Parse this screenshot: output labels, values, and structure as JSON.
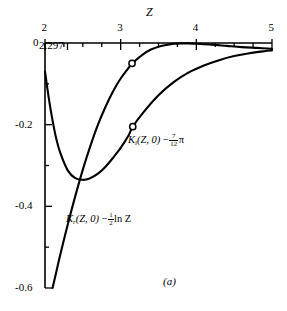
{
  "figure": {
    "caption": "(a)",
    "axis_name": "Z",
    "note_label": "2.297"
  },
  "chart_data": {
    "type": "line",
    "title": "",
    "xlabel": "Z",
    "ylabel": "",
    "xlim": [
      2,
      5
    ],
    "ylim": [
      -0.6,
      0.0
    ],
    "x_axis_position": "top",
    "y_axis_position": "left",
    "grid": false,
    "legend": "inline-annotations",
    "xticks": [
      2,
      3,
      4,
      5
    ],
    "xticklabels": [
      "2",
      "3",
      "4",
      "5"
    ],
    "x_minor_tick_step": 0.25,
    "yticks": [
      0,
      -0.2,
      -0.4,
      -0.6
    ],
    "yticklabels": [
      "0",
      "-0.2",
      "-0.4",
      "-0.6"
    ],
    "y_minor_tick_step": 0.1,
    "annotations": [
      {
        "text": "2.297",
        "x": 2.297,
        "note": "value marked below top axis"
      },
      {
        "text": "(a)",
        "note": "figure panel caption"
      }
    ],
    "markers": [
      {
        "series": "Ki(Z,0) - 7/12 pi",
        "x": 3.15,
        "y": -0.05,
        "style": "open-circle"
      },
      {
        "series": "Kr(Z,0) - 1/2 ln Z",
        "x": 3.16,
        "y": -0.205,
        "style": "open-circle"
      }
    ],
    "series": [
      {
        "name": "Ki(Z,0) - 7/12 pi",
        "label_text": "K i ( Z , 0 ) - 7/12 pi",
        "label_parts": {
          "fn": "K",
          "sub": "i",
          "args": "(Z, 0)",
          "minus": "−",
          "frac_num": "7",
          "frac_den": "12",
          "tail": "π"
        },
        "x": [
          2.1,
          2.15,
          2.2,
          2.3,
          2.4,
          2.5,
          2.6,
          2.7,
          2.8,
          2.9,
          3.0,
          3.1,
          3.15,
          3.2,
          3.3,
          3.4,
          3.5,
          3.6,
          3.7,
          3.8,
          3.9,
          4.0,
          4.2,
          4.4,
          4.6,
          4.8,
          5.0
        ],
        "y": [
          -0.6,
          -0.56,
          -0.52,
          -0.445,
          -0.375,
          -0.31,
          -0.252,
          -0.2,
          -0.156,
          -0.118,
          -0.087,
          -0.062,
          -0.051,
          -0.042,
          -0.027,
          -0.016,
          -0.009,
          -0.005,
          -0.002,
          -0.001,
          -0.001,
          -0.002,
          -0.004,
          -0.007,
          -0.01,
          -0.012,
          -0.014
        ]
      },
      {
        "name": "Kr(Z,0) - 1/2 ln Z",
        "label_text": "K r ( Z , 0 ) - 1/2 ln Z",
        "label_parts": {
          "fn": "K",
          "sub": "r",
          "args": "(Z, 0)",
          "minus": "−",
          "frac_num": "1",
          "frac_den": "2",
          "tail": "ln Z"
        },
        "x": [
          2.0,
          2.05,
          2.1,
          2.15,
          2.2,
          2.3,
          2.4,
          2.5,
          2.55,
          2.6,
          2.7,
          2.8,
          2.9,
          3.0,
          3.1,
          3.16,
          3.3,
          3.5,
          3.7,
          3.9,
          4.1,
          4.3,
          4.5,
          4.7,
          4.9,
          5.0
        ],
        "y": [
          -0.07,
          -0.135,
          -0.19,
          -0.235,
          -0.268,
          -0.312,
          -0.331,
          -0.335,
          -0.334,
          -0.331,
          -0.32,
          -0.303,
          -0.281,
          -0.257,
          -0.228,
          -0.205,
          -0.17,
          -0.128,
          -0.096,
          -0.072,
          -0.055,
          -0.042,
          -0.032,
          -0.025,
          -0.02,
          -0.018
        ]
      }
    ]
  }
}
